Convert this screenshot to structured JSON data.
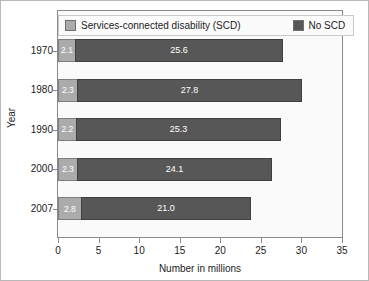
{
  "chart_data": {
    "type": "bar",
    "orientation": "horizontal",
    "stacked": true,
    "title": "",
    "xlabel": "Number in millions",
    "ylabel": "Year",
    "categories": [
      "1970",
      "1980",
      "1990",
      "2000",
      "2007"
    ],
    "series": [
      {
        "name": "Services-connected disability (SCD)",
        "color": "#ababab",
        "values": [
          2.1,
          2.3,
          2.2,
          2.3,
          2.8
        ],
        "labels": [
          "2.1",
          "2.3",
          "2.2",
          "2.3",
          "2.8"
        ]
      },
      {
        "name": "No SCD",
        "color": "#575757",
        "values": [
          25.6,
          27.8,
          25.3,
          24.1,
          21.0
        ],
        "labels": [
          "25.6",
          "27.8",
          "25.3",
          "24.1",
          "21.0"
        ]
      }
    ],
    "totals": [
      27.7,
      30.1,
      27.5,
      26.4,
      23.8
    ],
    "xlim": [
      0,
      35
    ],
    "xticks": [
      "0",
      "5",
      "10",
      "15",
      "20",
      "25",
      "30",
      "35"
    ],
    "grid": false,
    "legend_position": "top-inside",
    "legend": [
      {
        "label": "Services-connected disability (SCD)",
        "color": "#ababab"
      },
      {
        "label": "No SCD",
        "color": "#575757"
      }
    ]
  },
  "colors": {
    "scd": "#ababab",
    "no_scd": "#575757",
    "plot_background": "#fafafa",
    "frame": "#8a8a8a",
    "text": "#1b1b1b"
  }
}
